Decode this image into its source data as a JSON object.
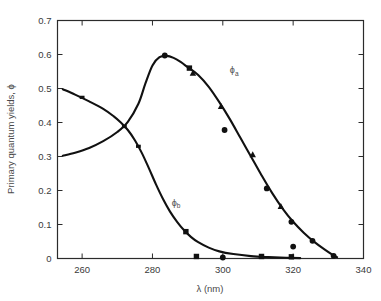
{
  "chart_data": {
    "type": "scatter",
    "title": "",
    "subtitle": "",
    "xlabel": "λ (nm)",
    "ylabel": "Primary quantum yields, ϕ",
    "xlim": [
      253,
      340
    ],
    "ylim": [
      0,
      0.7
    ],
    "xticks": [
      260,
      280,
      300,
      320,
      340
    ],
    "xtick_labels": [
      "260",
      "280",
      "300",
      "320",
      "340"
    ],
    "yticks": [
      0,
      0.1,
      0.2,
      0.3,
      0.4,
      0.5,
      0.6,
      0.7
    ],
    "ytick_labels": [
      "0",
      "0.1",
      "0.2",
      "0.3",
      "0.4",
      "0.5",
      "0.6",
      "0.7"
    ],
    "grid": false,
    "legend_position": "inline-annotation",
    "frame": "box",
    "tick_direction": "in",
    "axis_color": "#2b2b2b",
    "curve_color": "#111111",
    "annotations": [
      {
        "name": "phi-a-label",
        "text": "ϕ",
        "sub": "a",
        "x": 302,
        "y": 0.545
      },
      {
        "name": "phi-b-label",
        "text": "ϕ",
        "sub": "b",
        "x": 285.5,
        "y": 0.155
      }
    ],
    "series": [
      {
        "name": "ϕa",
        "label": "ϕa",
        "marker": "mixed",
        "curve": [
          [
            254.5,
            0.302
          ],
          [
            258,
            0.311
          ],
          [
            262,
            0.325
          ],
          [
            266,
            0.345
          ],
          [
            270,
            0.372
          ],
          [
            273,
            0.402
          ],
          [
            276,
            0.455
          ],
          [
            278,
            0.515
          ],
          [
            280,
            0.568
          ],
          [
            282,
            0.592
          ],
          [
            284,
            0.596
          ],
          [
            286,
            0.59
          ],
          [
            288,
            0.578
          ],
          [
            290,
            0.563
          ],
          [
            293,
            0.54
          ],
          [
            296,
            0.505
          ],
          [
            299,
            0.46
          ],
          [
            302,
            0.41
          ],
          [
            305,
            0.355
          ],
          [
            308,
            0.3
          ],
          [
            311,
            0.245
          ],
          [
            314,
            0.193
          ],
          [
            317,
            0.147
          ],
          [
            320,
            0.108
          ],
          [
            323,
            0.076
          ],
          [
            326,
            0.049
          ],
          [
            329,
            0.026
          ],
          [
            331.5,
            0.009
          ],
          [
            332.5,
            0.004
          ]
        ],
        "points": [
          {
            "x": 283.5,
            "y": 0.597,
            "marker": "circle"
          },
          {
            "x": 290.5,
            "y": 0.56,
            "marker": "square"
          },
          {
            "x": 291.5,
            "y": 0.545,
            "marker": "triangle"
          },
          {
            "x": 299.5,
            "y": 0.447,
            "marker": "triangle"
          },
          {
            "x": 300.5,
            "y": 0.378,
            "marker": "circle"
          },
          {
            "x": 308.5,
            "y": 0.305,
            "marker": "triangle"
          },
          {
            "x": 312.5,
            "y": 0.206,
            "marker": "circle"
          },
          {
            "x": 316.5,
            "y": 0.153,
            "marker": "triangle"
          },
          {
            "x": 319.5,
            "y": 0.108,
            "marker": "circle"
          },
          {
            "x": 320.0,
            "y": 0.035,
            "marker": "circle"
          },
          {
            "x": 325.5,
            "y": 0.052,
            "marker": "circle"
          },
          {
            "x": 331.5,
            "y": 0.008,
            "marker": "circle"
          }
        ]
      },
      {
        "name": "ϕb",
        "label": "ϕb",
        "marker": "mixed",
        "curve": [
          [
            254.5,
            0.498
          ],
          [
            258,
            0.482
          ],
          [
            262,
            0.462
          ],
          [
            266,
            0.44
          ],
          [
            269,
            0.418
          ],
          [
            271,
            0.4
          ],
          [
            273,
            0.378
          ],
          [
            275,
            0.348
          ],
          [
            277,
            0.31
          ],
          [
            279,
            0.265
          ],
          [
            281,
            0.218
          ],
          [
            283,
            0.175
          ],
          [
            285,
            0.138
          ],
          [
            287,
            0.108
          ],
          [
            289,
            0.083
          ],
          [
            291,
            0.063
          ],
          [
            293,
            0.048
          ],
          [
            296,
            0.032
          ],
          [
            299,
            0.021
          ],
          [
            303,
            0.013
          ],
          [
            308,
            0.007
          ],
          [
            313,
            0.004
          ],
          [
            318,
            0.002
          ],
          [
            322,
            0.001
          ]
        ],
        "points": [
          {
            "x": 260.0,
            "y": 0.474,
            "marker": "tick"
          },
          {
            "x": 272.0,
            "y": 0.388,
            "marker": "tick"
          },
          {
            "x": 276.0,
            "y": 0.33,
            "marker": "tick"
          },
          {
            "x": 289.5,
            "y": 0.079,
            "marker": "square"
          },
          {
            "x": 292.5,
            "y": 0.006,
            "marker": "square"
          },
          {
            "x": 300.0,
            "y": 0.003,
            "marker": "circle"
          },
          {
            "x": 311.0,
            "y": 0.006,
            "marker": "square"
          },
          {
            "x": 319.5,
            "y": 0.005,
            "marker": "square"
          }
        ]
      }
    ]
  }
}
